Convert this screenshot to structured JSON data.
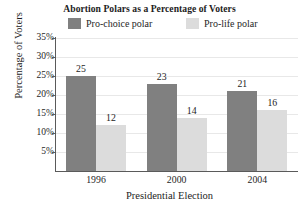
{
  "chart_data": {
    "type": "bar",
    "title": "Abortion Polars as a Percentage of Voters",
    "xlabel": "Presidential Election",
    "ylabel": "Percentage of Voters",
    "categories": [
      "1996",
      "2000",
      "2004"
    ],
    "series": [
      {
        "name": "Pro-choice polar",
        "color": "#808080",
        "values": [
          25,
          23,
          21
        ],
        "value_labels": [
          "25",
          "23",
          "21"
        ]
      },
      {
        "name": "Pro-life polar",
        "color": "#dcdcdc",
        "values": [
          12,
          14,
          16
        ],
        "value_labels": [
          "12",
          "14",
          "16"
        ]
      }
    ],
    "ylim": [
      0,
      35
    ],
    "ytick_values": [
      35,
      30,
      25,
      20,
      15,
      10,
      5
    ],
    "ytick_labels": [
      "35%",
      "30%",
      "25%",
      "20%",
      "15%",
      "10%",
      "5%"
    ],
    "grid": true,
    "grid_axis": "y",
    "legend_position": "top",
    "axis_color": "#5a5a5a",
    "grid_color": "#e8e8e8",
    "background_color": "#ffffff",
    "text_color": "#1d1d1d"
  },
  "legend": {
    "entries": [
      {
        "label": "Pro-choice polar",
        "swatch": "#808080"
      },
      {
        "label": "Pro-life polar",
        "swatch": "#dcdcdc"
      }
    ]
  }
}
